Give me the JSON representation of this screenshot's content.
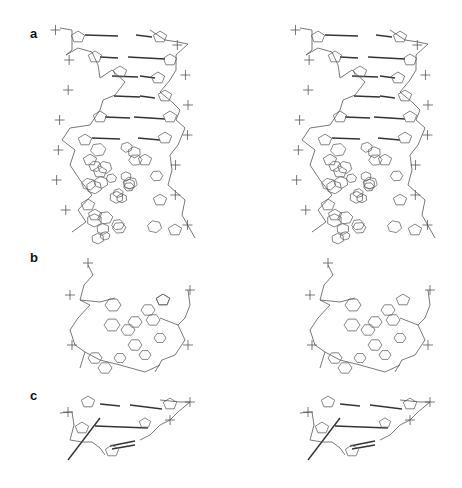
{
  "figure": {
    "type": "stereo molecular structure figure",
    "panels": [
      {
        "label": "a",
        "description": "Stereo view of duplex DNA helix, side view"
      },
      {
        "label": "b",
        "description": "Stereo view of duplex, view down helix axis with stacked base rings"
      },
      {
        "label": "c",
        "description": "Stereo view of a short base-paired segment"
      }
    ],
    "views_per_panel": [
      "left-eye",
      "right-eye"
    ],
    "line_color": "#555555",
    "background": "#ffffff"
  }
}
